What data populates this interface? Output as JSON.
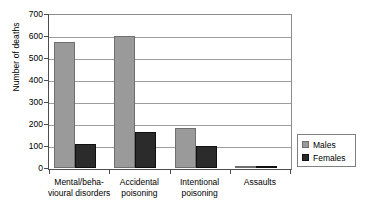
{
  "chart_data": {
    "type": "bar",
    "title": "",
    "xlabel": "",
    "ylabel": "Number of deaths",
    "ylim": [
      0,
      700
    ],
    "ytick_values": [
      0,
      100,
      200,
      300,
      400,
      500,
      600,
      700
    ],
    "ytick_labels": [
      "0",
      "100",
      "200",
      "300",
      "400",
      "500",
      "600",
      "700"
    ],
    "grid": true,
    "legend_position": "right",
    "categories": [
      "Mental/beha-\nvioural disorders",
      "Accidental\npoisoning",
      "Intentional\npoisoning",
      "Assaults"
    ],
    "series": [
      {
        "name": "Males",
        "color": "#9a9a9a",
        "values": [
          575,
          598,
          182,
          8
        ]
      },
      {
        "name": "Females",
        "color": "#2b2b2b",
        "values": [
          110,
          165,
          100,
          5
        ]
      }
    ]
  },
  "legend": {
    "items": [
      {
        "label": "Males",
        "swatch": "male-swatch"
      },
      {
        "label": "Females",
        "swatch": "female-swatch"
      }
    ]
  }
}
